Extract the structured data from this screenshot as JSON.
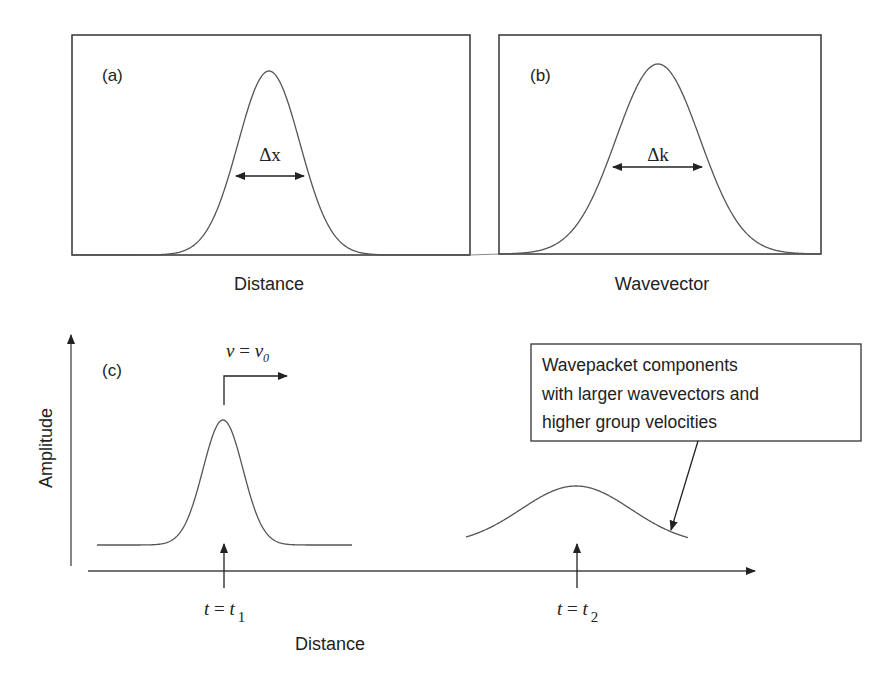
{
  "chart_data": [
    {
      "type": "line",
      "panel": "(a)",
      "title": "",
      "xlabel": "Distance",
      "ylabel": "",
      "series": [
        {
          "name": "wavepacket",
          "shape": "gaussian",
          "center_rel": 0.5,
          "width_rel": 0.1
        }
      ],
      "annotations": [
        {
          "text": "Δx",
          "type": "double-arrow",
          "meaning": "spatial width"
        }
      ],
      "grid": false
    },
    {
      "type": "line",
      "panel": "(b)",
      "title": "",
      "xlabel": "Wavevector",
      "ylabel": "",
      "series": [
        {
          "name": "spectrum",
          "shape": "gaussian",
          "center_rel": 0.49,
          "width_rel": 0.16
        }
      ],
      "annotations": [
        {
          "text": "Δk",
          "type": "double-arrow",
          "meaning": "wavevector width"
        }
      ],
      "grid": false
    },
    {
      "type": "line",
      "panel": "(c)",
      "title": "",
      "xlabel": "Distance",
      "ylabel": "Amplitude",
      "series": [
        {
          "name": "t = t1",
          "shape": "gaussian",
          "peak": "narrow, tall"
        },
        {
          "name": "t = t2",
          "shape": "gaussian",
          "peak": "broad, short (dispersed)"
        }
      ],
      "annotations": [
        {
          "text": "v = v0",
          "type": "velocity-arrow"
        },
        {
          "text": "t = t1",
          "type": "marker-arrow"
        },
        {
          "text": "t = t2",
          "type": "marker-arrow"
        },
        {
          "text": "Wavepacket components with larger wavevectors and higher group velocities",
          "type": "callout"
        }
      ],
      "grid": false
    }
  ],
  "panels": {
    "a": {
      "label": "(a)",
      "xlabel": "Distance",
      "width_label": "Δx"
    },
    "b": {
      "label": "(b)",
      "xlabel": "Wavevector",
      "width_label": "Δk"
    },
    "c": {
      "label": "(c)",
      "xlabel": "Distance",
      "ylabel": "Amplitude",
      "velocity_label": {
        "var": "v",
        "eq": " = ",
        "sym": "v",
        "sub": "0"
      },
      "t1_label": {
        "var": "t",
        "eq": " = ",
        "sym": "t",
        "sub": "1"
      },
      "t2_label": {
        "var": "t",
        "eq": " = ",
        "sym": "t",
        "sub": "2"
      },
      "callout_lines": [
        "Wavepacket components",
        "with larger wavevectors and",
        "higher group velocities"
      ]
    }
  },
  "colors": {
    "line": "#555555",
    "frame": "#333333",
    "text": "#222222"
  }
}
